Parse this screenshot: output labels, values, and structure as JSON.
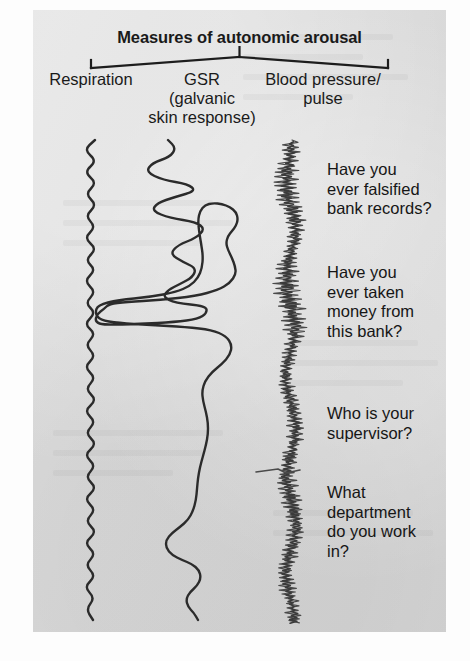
{
  "figure": {
    "title": "Measures of autonomic arousal",
    "background_color": "#d9d9d9",
    "ink_color": "#2b2b2b",
    "page_color": "#fdfdfd"
  },
  "measures": [
    {
      "id": "respiration",
      "label": "Respiration"
    },
    {
      "id": "gsr",
      "label": "GSR\n(galvanic\nskin response)"
    },
    {
      "id": "blood-pressure",
      "label": "Blood pressure/\npulse"
    }
  ],
  "questions": [
    {
      "id": "q1",
      "text": "Have you\never falsified\nbank records?"
    },
    {
      "id": "q2",
      "text": "Have you\never taken\nmoney from\nthis bank?"
    },
    {
      "id": "q3",
      "text": "Who is your\nsupervisor?"
    },
    {
      "id": "q4",
      "text": "What\ndepartment\ndo you work\nin?"
    }
  ],
  "chart_data": {
    "type": "line",
    "title": "Measures of autonomic arousal",
    "orientation": "vertical-time",
    "xlabel": "",
    "ylabel": "time (top to bottom)",
    "grid": false,
    "legend": "top-bracket",
    "axis_note": "Each trace runs top-to-bottom; horizontal deflection = signal amplitude.",
    "trace_span_y": [
      140,
      622
    ],
    "series": [
      {
        "name": "Respiration",
        "baseline_x": 90,
        "stroke": "#2b2b2b",
        "stroke_width": 2.4,
        "description": "Regular sinusoidal breathing rhythm, near-constant amplitude and period throughout.",
        "waveform": "sine",
        "amplitude": 9,
        "period": 25,
        "points": [
          [
            95,
            140
          ],
          [
            84,
            150
          ],
          [
            97,
            161
          ],
          [
            84,
            172
          ],
          [
            97,
            183
          ],
          [
            85,
            194
          ],
          [
            97,
            205
          ],
          [
            85,
            216
          ],
          [
            96,
            227
          ],
          [
            84,
            238
          ],
          [
            97,
            249
          ],
          [
            85,
            260
          ],
          [
            96,
            270
          ],
          [
            84,
            281
          ],
          [
            96,
            292
          ],
          [
            85,
            303
          ],
          [
            96,
            313
          ],
          [
            84,
            324
          ],
          [
            96,
            334
          ],
          [
            85,
            345
          ],
          [
            96,
            356
          ],
          [
            84,
            367
          ],
          [
            96,
            378
          ],
          [
            85,
            389
          ],
          [
            97,
            400
          ],
          [
            84,
            411
          ],
          [
            96,
            422
          ],
          [
            85,
            433
          ],
          [
            97,
            444
          ],
          [
            84,
            455
          ],
          [
            96,
            466
          ],
          [
            85,
            477
          ],
          [
            97,
            488
          ],
          [
            84,
            499
          ],
          [
            96,
            510
          ],
          [
            85,
            521
          ],
          [
            97,
            532
          ],
          [
            84,
            543
          ],
          [
            96,
            554
          ],
          [
            85,
            565
          ],
          [
            96,
            576
          ],
          [
            84,
            587
          ],
          [
            95,
            598
          ],
          [
            86,
            609
          ],
          [
            93,
            620
          ]
        ]
      },
      {
        "name": "GSR (galvanic skin response)",
        "baseline_x": 185,
        "stroke": "#2b2b2b",
        "stroke_width": 2.4,
        "description": "Large slow deflections; two big left-going excursions aligned with the first two accusatory questions, then a settled drift.",
        "points": [
          [
            168,
            140
          ],
          [
            176,
            148
          ],
          [
            170,
            157
          ],
          [
            152,
            163
          ],
          [
            146,
            172
          ],
          [
            163,
            180
          ],
          [
            188,
            184
          ],
          [
            196,
            191
          ],
          [
            175,
            197
          ],
          [
            157,
            203
          ],
          [
            152,
            211
          ],
          [
            170,
            218
          ],
          [
            196,
            222
          ],
          [
            205,
            229
          ],
          [
            196,
            238
          ],
          [
            178,
            245
          ],
          [
            170,
            254
          ],
          [
            183,
            262
          ],
          [
            196,
            268
          ],
          [
            193,
            277
          ],
          [
            180,
            284
          ],
          [
            168,
            290
          ],
          [
            163,
            297
          ],
          [
            175,
            303
          ],
          [
            206,
            306
          ],
          [
            207,
            313
          ],
          [
            198,
            319
          ],
          [
            175,
            322
          ],
          [
            140,
            324
          ],
          [
            104,
            325
          ],
          [
            95,
            322
          ],
          [
            97,
            314
          ],
          [
            104,
            309
          ],
          [
            109,
            304
          ],
          [
            126,
            302
          ],
          [
            160,
            300
          ],
          [
            196,
            296
          ],
          [
            218,
            290
          ],
          [
            230,
            283
          ],
          [
            236,
            274
          ],
          [
            235,
            266
          ],
          [
            232,
            258
          ],
          [
            228,
            250
          ],
          [
            226,
            243
          ],
          [
            228,
            236
          ],
          [
            232,
            231
          ],
          [
            236,
            226
          ],
          [
            238,
            219
          ],
          [
            236,
            212
          ],
          [
            230,
            207
          ],
          [
            222,
            204
          ],
          [
            213,
            203
          ],
          [
            205,
            205
          ],
          [
            200,
            211
          ],
          [
            198,
            220
          ],
          [
            199,
            231
          ],
          [
            201,
            243
          ],
          [
            203,
            256
          ],
          [
            202,
            268
          ],
          [
            198,
            278
          ],
          [
            190,
            286
          ],
          [
            176,
            292
          ],
          [
            150,
            297
          ],
          [
            118,
            300
          ],
          [
            98,
            305
          ],
          [
            95,
            313
          ],
          [
            100,
            320
          ],
          [
            118,
            323
          ],
          [
            150,
            325
          ],
          [
            186,
            327
          ],
          [
            212,
            330
          ],
          [
            226,
            336
          ],
          [
            232,
            345
          ],
          [
            230,
            355
          ],
          [
            222,
            364
          ],
          [
            212,
            372
          ],
          [
            205,
            381
          ],
          [
            202,
            391
          ],
          [
            203,
            401
          ],
          [
            206,
            412
          ],
          [
            208,
            423
          ],
          [
            208,
            434
          ],
          [
            206,
            445
          ],
          [
            203,
            456
          ],
          [
            200,
            467
          ],
          [
            198,
            478
          ],
          [
            197,
            489
          ],
          [
            196,
            500
          ],
          [
            193,
            511
          ],
          [
            188,
            520
          ],
          [
            180,
            527
          ],
          [
            172,
            533
          ],
          [
            166,
            540
          ],
          [
            166,
            548
          ],
          [
            172,
            555
          ],
          [
            182,
            560
          ],
          [
            192,
            564
          ],
          [
            199,
            570
          ],
          [
            201,
            578
          ],
          [
            197,
            586
          ],
          [
            190,
            592
          ],
          [
            186,
            599
          ],
          [
            188,
            607
          ],
          [
            194,
            613
          ],
          [
            198,
            620
          ]
        ]
      },
      {
        "name": "Blood pressure/pulse",
        "baseline_x": 288,
        "stroke": "#4a4a4a",
        "stroke_width": 1.2,
        "description": "Dense high-frequency pulse band; the band's centre drifts and the band widens during the two accusatory questions. A sharp single horizontal spike appears near y=470.",
        "band_half_width": 9,
        "pulse_period": 5,
        "centerline": [
          [
            292,
            140
          ],
          [
            291,
            150
          ],
          [
            289,
            160
          ],
          [
            287,
            170
          ],
          [
            286,
            180
          ],
          [
            287,
            190
          ],
          [
            289,
            200
          ],
          [
            292,
            210
          ],
          [
            295,
            220
          ],
          [
            296,
            230
          ],
          [
            295,
            240
          ],
          [
            292,
            250
          ],
          [
            289,
            260
          ],
          [
            287,
            270
          ],
          [
            286,
            280
          ],
          [
            287,
            290
          ],
          [
            289,
            300
          ],
          [
            292,
            310
          ],
          [
            294,
            320
          ],
          [
            295,
            330
          ],
          [
            294,
            340
          ],
          [
            291,
            350
          ],
          [
            288,
            360
          ],
          [
            286,
            370
          ],
          [
            285,
            380
          ],
          [
            287,
            390
          ],
          [
            290,
            400
          ],
          [
            293,
            410
          ],
          [
            295,
            420
          ],
          [
            296,
            430
          ],
          [
            295,
            440
          ],
          [
            292,
            450
          ],
          [
            289,
            460
          ],
          [
            287,
            470
          ],
          [
            286,
            480
          ],
          [
            288,
            490
          ],
          [
            291,
            500
          ],
          [
            294,
            510
          ],
          [
            296,
            520
          ],
          [
            296,
            530
          ],
          [
            294,
            540
          ],
          [
            291,
            550
          ],
          [
            288,
            560
          ],
          [
            286,
            570
          ],
          [
            286,
            580
          ],
          [
            288,
            590
          ],
          [
            291,
            600
          ],
          [
            293,
            610
          ],
          [
            294,
            620
          ]
        ],
        "spike": {
          "y": 470,
          "x_from": 256,
          "x_to": 300
        }
      }
    ],
    "annotations": [
      {
        "text": "Have you ever falsified bank records?",
        "y": 160
      },
      {
        "text": "Have you ever taken money from this bank?",
        "y": 263
      },
      {
        "text": "Who is your supervisor?",
        "y": 404
      },
      {
        "text": "What department do you work in?",
        "y": 483
      }
    ]
  }
}
